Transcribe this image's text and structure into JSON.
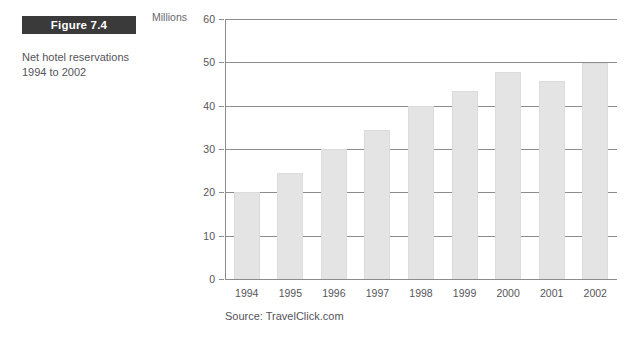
{
  "figure": {
    "badge_label": "Figure 7.4",
    "caption": "Net hotel reservations 1994 to 2002"
  },
  "source": {
    "text": "Source: TravelClick.com"
  },
  "colors": {
    "badge_background": "#3a3a3a",
    "badge_text": "#ffffff",
    "bar_fill": "#e4e4e4",
    "gridline": "#8c8c8c",
    "axis_text": "#56555a",
    "page_background": "#ffffff"
  },
  "chart_data": {
    "type": "bar",
    "title": "Figure 7.4",
    "subtitle": "Net hotel reservations 1994 to 2002",
    "xlabel": "",
    "ylabel": "Millions",
    "categories": [
      "1994",
      "1995",
      "1996",
      "1997",
      "1998",
      "1999",
      "2000",
      "2001",
      "2002"
    ],
    "values": [
      20,
      24.5,
      30,
      34.4,
      40,
      43.5,
      47.7,
      45.8,
      49.8
    ],
    "ylim": [
      0,
      60
    ],
    "yticks": [
      0,
      10,
      20,
      30,
      40,
      50,
      60
    ],
    "ytick_labels": [
      "0",
      "10",
      "20",
      "30",
      "40",
      "50",
      "60"
    ],
    "grid": true,
    "legend": "none",
    "annotations": [
      "Source: TravelClick.com"
    ]
  }
}
